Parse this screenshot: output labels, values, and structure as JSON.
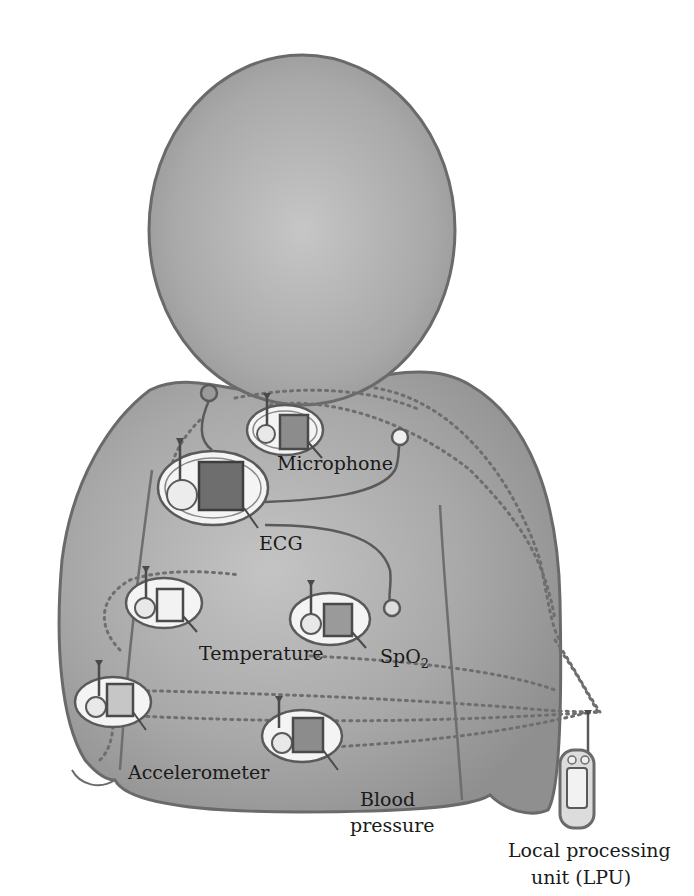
{
  "diagram": {
    "colors": {
      "background": "#ffffff",
      "body_fill": "#a9a9a9",
      "body_outline": "#6e6e6e",
      "sensor_pad": "#f2f2f2",
      "dark_chip": "#6f6f6f",
      "mid_chip": "#8f8f8f",
      "light_chip": "#dcdcdc",
      "link_dots": "#777777",
      "text": "#1a1a1a"
    },
    "sensors": [
      {
        "id": "microphone",
        "label": "Microphone"
      },
      {
        "id": "ecg",
        "label": "ECG"
      },
      {
        "id": "temperature",
        "label": "Temperature"
      },
      {
        "id": "spo2",
        "label": "SpO",
        "subscript": "2"
      },
      {
        "id": "accelerometer",
        "label": "Accelerometer"
      },
      {
        "id": "blood-pressure",
        "label_line1": "Blood",
        "label_line2": "pressure"
      }
    ],
    "lpu": {
      "label_line1": "Local processing",
      "label_line2": "unit (LPU)"
    }
  }
}
